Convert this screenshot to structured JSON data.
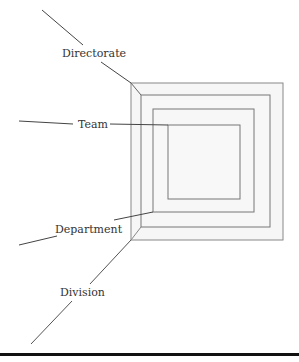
{
  "diagram": {
    "type": "nested-squares",
    "labels": {
      "directorate": "Directorate",
      "team": "Team",
      "department": "Department",
      "division": "Division"
    },
    "colors": {
      "stroke": "#777777",
      "fill": "#f6f6f6",
      "leader": "#444444",
      "rule": "#111111"
    },
    "levels_outer_to_inner": [
      "Division",
      "Directorate",
      "Department",
      "Team"
    ]
  }
}
